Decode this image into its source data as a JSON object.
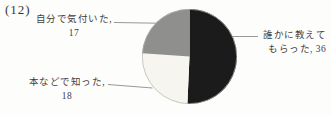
{
  "figure": {
    "number": "(12)",
    "callouts": {
      "noticed_myself": {
        "line1": "自分で気付いた,",
        "line2": "17"
      },
      "learned_from_books": {
        "line1": "本などで知った,",
        "line2": "18"
      },
      "told_by_someone": {
        "line1": "誰かに教えて",
        "line2": "もらった, 36"
      }
    }
  },
  "chart_data": {
    "type": "pie",
    "title": "(12)",
    "labels": [
      "誰かに教えてもらった",
      "本などで知った",
      "自分で気付いた"
    ],
    "keys": [
      "told-by-someone",
      "learned-from-books",
      "noticed-myself"
    ],
    "values": [
      36,
      18,
      17
    ],
    "total": 71,
    "colors": [
      "#1b1b1b",
      "#f6f5ef",
      "#8f8f8d"
    ],
    "start_angle_deg": 0,
    "direction": "clockwise",
    "outline_color": "#b3b1ab",
    "leader_line_color": "#8c8c8c",
    "legend_position": "callout-labels"
  }
}
